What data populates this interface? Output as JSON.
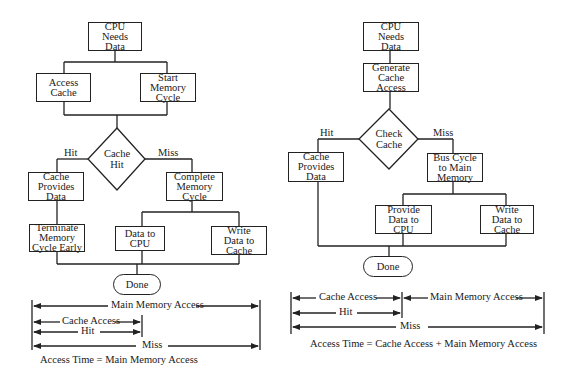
{
  "left_flowchart": {
    "start": "CPU Needs Data",
    "start_lines": [
      "CPU",
      "Needs",
      "Data"
    ],
    "access_cache": "Access Cache",
    "start_memory_cycle": "Start Memory Cycle",
    "decision": "Cache Hit",
    "hit_label": "Hit",
    "miss_label": "Miss",
    "cache_provides_data": "Cache Provides Data",
    "complete_memory_cycle": "Complete Memory Cycle",
    "terminate_memory_cycle": "Terminate Memory Cycle Early",
    "data_to_cpu": "Data to CPU",
    "write_data_to_cache": "Write Data to Cache",
    "done": "Done",
    "timing": {
      "main_memory_access": "Main Memory Access",
      "cache_access": "Cache Access",
      "hit": "Hit",
      "miss": "Miss"
    },
    "caption": "Access Time = Main Memory Access"
  },
  "right_flowchart": {
    "start": "CPU Needs Data",
    "generate_cache_access": "Generate Cache Access",
    "decision": "Check Cache",
    "hit_label": "Hit",
    "miss_label": "Miss",
    "cache_provides_data": "Cache Provides Data",
    "bus_cycle": "Bus Cycle to Main Memory",
    "provide_data_to_cpu": "Provide Data to CPU",
    "write_data_to_cache": "Write Data to Cache",
    "done": "Done",
    "timing": {
      "cache_access": "Cache Access",
      "main_memory_access": "Main Memory Access",
      "hit": "Hit",
      "miss": "Miss"
    },
    "caption": "Access Time = Cache Access + Main Memory Access"
  }
}
